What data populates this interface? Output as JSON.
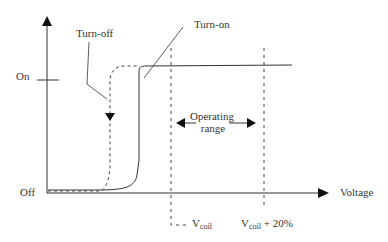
{
  "diagram": {
    "type": "relay-hysteresis-characteristic",
    "y_axis": {
      "labels": {
        "on": "On",
        "off": "Off"
      }
    },
    "x_axis": {
      "label": "Voltage"
    },
    "curves": {
      "turn_off": {
        "label": "Turn-off",
        "style": "dashed"
      },
      "turn_on": {
        "label": "Turn-on",
        "style": "solid"
      }
    },
    "operating_range": {
      "line1": "Operating",
      "line2": "range"
    },
    "markers": {
      "vcoil": {
        "main": "V",
        "sub": "coil",
        "suffix": ""
      },
      "vcoil_plus": {
        "main": "V",
        "sub": "coil",
        "suffix": " + 20%"
      }
    },
    "colors": {
      "line": "#333333",
      "background": "#ffffff"
    }
  }
}
